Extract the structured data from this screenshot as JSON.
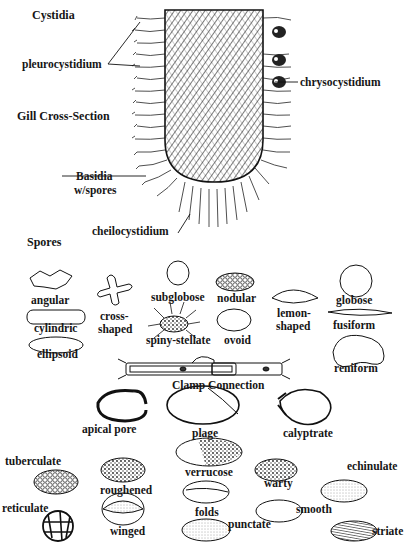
{
  "headings": {
    "cystidia": "Cystidia",
    "gill_cross_section": "Gill Cross-Section",
    "spores": "Spores"
  },
  "gill_labels": {
    "pleurocystidium": "pleurocystidium",
    "chrysocystidium": "chrysocystidium",
    "basidia_line1": "Basidia",
    "basidia_line2": "w/spores",
    "cheilocystidium": "cheilocystidium"
  },
  "spores": {
    "angular": "angular",
    "cross_shaped_line1": "cross-",
    "cross_shaped_line2": "shaped",
    "subglobose": "subglobose",
    "nodular": "nodular",
    "lemon_shaped_line1": "lemon-",
    "lemon_shaped_line2": "shaped",
    "globose": "globose",
    "cylindric": "cylindric",
    "spiny_stellate": "spiny-stellate",
    "ovoid": "ovoid",
    "fusiform": "fusiform",
    "ellipsoid": "ellipsoid",
    "reniform": "reniform",
    "clamp_connection": "Clamp Connection",
    "apical_pore": "apical pore",
    "plage": "plage",
    "calyptrate": "calyptrate"
  },
  "ornamentation": {
    "tuberculate": "tuberculate",
    "roughened": "roughened",
    "verrucose": "verrucose",
    "warty": "warty",
    "echinulate": "echinulate",
    "reticulate": "reticulate",
    "folds": "folds",
    "smooth": "smooth",
    "winged": "winged",
    "punctate": "punctate",
    "striate": "striate"
  },
  "colors": {
    "ink": "#161616",
    "background": "#ffffff",
    "hatch": "#3a3a3a"
  }
}
